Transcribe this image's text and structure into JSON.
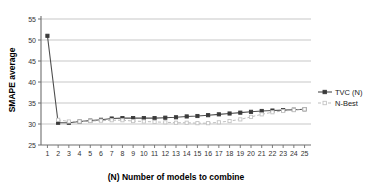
{
  "chart_data": {
    "type": "line",
    "title": "",
    "xlabel": "(N) Number of models to combine",
    "ylabel": "SMAPE average",
    "x": [
      1,
      2,
      3,
      4,
      5,
      6,
      7,
      8,
      9,
      10,
      11,
      12,
      13,
      14,
      15,
      16,
      17,
      18,
      19,
      20,
      21,
      22,
      23,
      24,
      25
    ],
    "xtick_labels": [
      "1",
      "2",
      "3",
      "4",
      "5",
      "6",
      "7",
      "8",
      "9",
      "10",
      "11",
      "12",
      "13",
      "14",
      "15",
      "16",
      "17",
      "18",
      "19",
      "20",
      "21",
      "22",
      "23",
      "24",
      "25"
    ],
    "ytick_labels": [
      "25",
      "30",
      "35",
      "40",
      "45",
      "50",
      "55"
    ],
    "yticks": [
      25,
      30,
      35,
      40,
      45,
      50,
      55
    ],
    "xlim": [
      0.4,
      25.6
    ],
    "ylim": [
      25,
      55
    ],
    "grid": "horizontal",
    "legend_position": "right-top-outside",
    "series": [
      {
        "name": "TVC (N)",
        "marker": "filled-square",
        "line_style": "solid",
        "color": "#4d4d4d",
        "marker_color": "#3a3a3a",
        "values": [
          51.0,
          30.3,
          30.3,
          30.6,
          30.8,
          31.0,
          31.3,
          31.4,
          31.4,
          31.4,
          31.4,
          31.5,
          31.6,
          31.8,
          31.9,
          32.1,
          32.3,
          32.5,
          32.7,
          32.9,
          33.1,
          33.2,
          33.3,
          33.4,
          33.5
        ]
      },
      {
        "name": "N-Best",
        "marker": "open-square",
        "line_style": "dashed",
        "color": "#b5b5b5",
        "marker_color": "#c4c4c4",
        "values": [
          null,
          31.0,
          30.6,
          30.6,
          30.7,
          30.8,
          30.9,
          30.9,
          30.7,
          30.6,
          30.5,
          30.4,
          30.3,
          30.3,
          30.2,
          30.2,
          30.4,
          30.7,
          31.1,
          31.7,
          32.3,
          32.8,
          33.1,
          33.3,
          33.5
        ]
      }
    ]
  },
  "legend": {
    "items": [
      {
        "label": "TVC (N)"
      },
      {
        "label": "N-Best"
      }
    ]
  }
}
